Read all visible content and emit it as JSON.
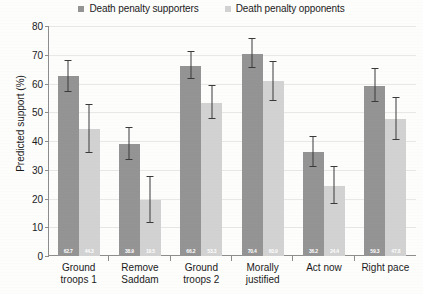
{
  "chart_data": {
    "type": "bar",
    "title": "",
    "xlabel": "",
    "ylabel": "Predicted support (%)",
    "ylim": [
      0,
      80
    ],
    "yticks": [
      0,
      10,
      20,
      30,
      40,
      50,
      60,
      70,
      80
    ],
    "grid": true,
    "legend_position": "top-center",
    "categories": [
      "Ground troops 1",
      "Remove Saddam",
      "Ground troops 2",
      "Morally justified",
      "Act now",
      "Right pace"
    ],
    "category_lines": [
      [
        "Ground",
        "troops 1"
      ],
      [
        "Remove",
        "Saddam"
      ],
      [
        "Ground",
        "troops 2"
      ],
      [
        "Morally",
        "justified"
      ],
      [
        "Act now",
        ""
      ],
      [
        "Right pace",
        ""
      ]
    ],
    "series": [
      {
        "name": "Death penalty supporters",
        "color": "#949494",
        "values": [
          62.7,
          38.9,
          66.2,
          70.4,
          36.2,
          59.3
        ],
        "err_low": [
          57.0,
          33.5,
          61.5,
          65.5,
          31.0,
          53.5
        ],
        "err_high": [
          68.0,
          44.5,
          71.0,
          75.5,
          41.5,
          65.0
        ]
      },
      {
        "name": "Death penalty opponents",
        "color": "#d2d2d2",
        "values": [
          44.3,
          19.5,
          53.3,
          60.9,
          24.4,
          47.8
        ],
        "err_low": [
          36.0,
          11.5,
          47.5,
          54.0,
          18.0,
          40.5
        ],
        "err_high": [
          52.5,
          27.5,
          59.0,
          67.5,
          31.0,
          55.0
        ]
      }
    ]
  },
  "legend": {
    "items": [
      {
        "label": "Death penalty supporters",
        "color": "#949494"
      },
      {
        "label": "Death penalty opponents",
        "color": "#d2d2d2"
      }
    ]
  }
}
